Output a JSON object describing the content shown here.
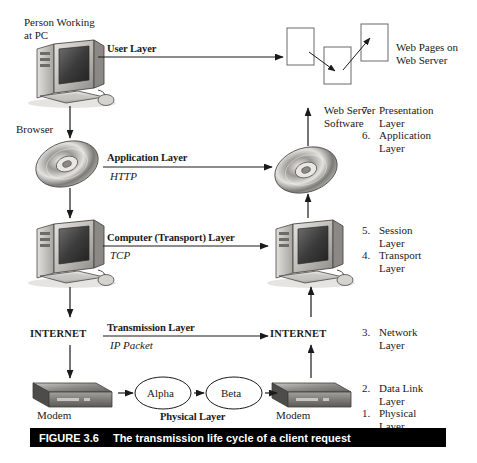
{
  "figure": {
    "number": "FIGURE 3.6",
    "caption": "The transmission life cycle of a client request"
  },
  "nodes": {
    "person_pc": "Person Working\nat PC",
    "browser": "Browser",
    "internet_left": "INTERNET",
    "internet_right": "INTERNET",
    "modem_left": "Modem",
    "modem_right": "Modem",
    "alpha": "Alpha",
    "beta": "Beta",
    "web_pages": "Web Pages on\nWeb Server",
    "web_server_software": "Web Server\nSoftware"
  },
  "layers": [
    {
      "name": "User Layer",
      "protocol": ""
    },
    {
      "name": "Application Layer",
      "protocol": "HTTP"
    },
    {
      "name": "Computer (Transport) Layer",
      "protocol": "TCP"
    },
    {
      "name": "Transmission Layer",
      "protocol": "IP Packet"
    },
    {
      "name": "Physical Layer",
      "protocol": ""
    }
  ],
  "osi_layers": [
    {
      "number": "7.",
      "label": "Presentation\nLayer"
    },
    {
      "number": "6.",
      "label": "Application\nLayer"
    },
    {
      "number": "5.",
      "label": "Session\nLayer"
    },
    {
      "number": "4.",
      "label": "Transport\nLayer"
    },
    {
      "number": "3.",
      "label": "Network\nLayer"
    },
    {
      "number": "2.",
      "label": "Data Link\nLayer"
    },
    {
      "number": "1.",
      "label": "Physical\nLayer"
    }
  ],
  "colors": {
    "line": "#1a1a1a",
    "caption_bg": "#000000",
    "caption_fg": "#ffffff",
    "device_light": "#d8d6d2",
    "device_mid": "#9a9893",
    "device_dark": "#5d5b58",
    "screen_dark": "#3a3a3a"
  }
}
